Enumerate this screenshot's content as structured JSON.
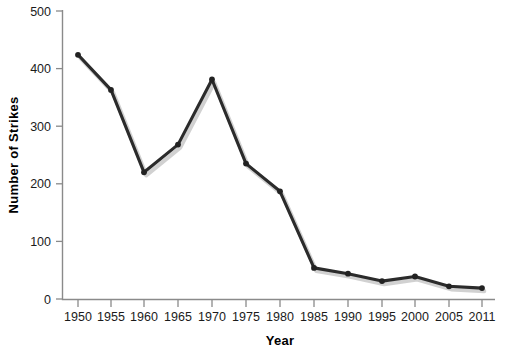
{
  "chart_data": {
    "type": "line",
    "title": "",
    "xlabel": "Year",
    "ylabel": "Number of Strikes",
    "x": [
      1950,
      1955,
      1960,
      1965,
      1970,
      1975,
      1980,
      1985,
      1990,
      1995,
      2000,
      2005,
      2011
    ],
    "categories": [
      "1950",
      "1955",
      "1960",
      "1965",
      "1970",
      "1975",
      "1980",
      "1985",
      "1990",
      "1995",
      "2000",
      "2005",
      "2011"
    ],
    "values": [
      424,
      363,
      220,
      268,
      381,
      235,
      187,
      54,
      44,
      31,
      39,
      22,
      19
    ],
    "series": [
      {
        "name": "Number of Strikes",
        "values": [
          424,
          363,
          220,
          268,
          381,
          235,
          187,
          54,
          44,
          31,
          39,
          22,
          19
        ]
      }
    ],
    "ylim": [
      0,
      500
    ],
    "yticks": [
      0,
      100,
      200,
      300,
      400,
      500
    ],
    "yticklabels": [
      "0",
      "100",
      "200",
      "300",
      "400",
      "500"
    ],
    "xticklabels": [
      "1950",
      "1955",
      "1960",
      "1965",
      "1970",
      "1975",
      "1980",
      "1985",
      "1990",
      "1995",
      "2000",
      "2005",
      "2011"
    ],
    "grid": false,
    "legend": false,
    "legend_position": "none",
    "line_color": "#2b2b2b",
    "marker": "circle",
    "marker_color": "#222222",
    "background_color": "#ffffff",
    "axis_color": "#8a8a8a"
  }
}
